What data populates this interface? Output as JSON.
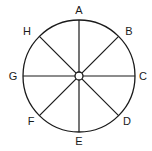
{
  "diagram": {
    "type": "circle-compass",
    "center": [
      79,
      76
    ],
    "radius": 56,
    "stroke_color": "#1a1a1a",
    "hub_radius": 4,
    "spokes": 8,
    "labels": [
      {
        "id": "A",
        "text": "A",
        "angle_deg": 90,
        "x": 79,
        "y": 14
      },
      {
        "id": "B",
        "text": "B",
        "angle_deg": 45,
        "x": 129,
        "y": 35
      },
      {
        "id": "C",
        "text": "C",
        "angle_deg": 0,
        "x": 143,
        "y": 80
      },
      {
        "id": "D",
        "text": "D",
        "angle_deg": -45,
        "x": 127,
        "y": 125
      },
      {
        "id": "E",
        "text": "E",
        "angle_deg": -90,
        "x": 79,
        "y": 145
      },
      {
        "id": "F",
        "text": "F",
        "angle_deg": -135,
        "x": 31,
        "y": 125
      },
      {
        "id": "G",
        "text": "G",
        "angle_deg": 180,
        "x": 13,
        "y": 80
      },
      {
        "id": "H",
        "text": "H",
        "angle_deg": 135,
        "x": 27,
        "y": 35
      }
    ]
  }
}
